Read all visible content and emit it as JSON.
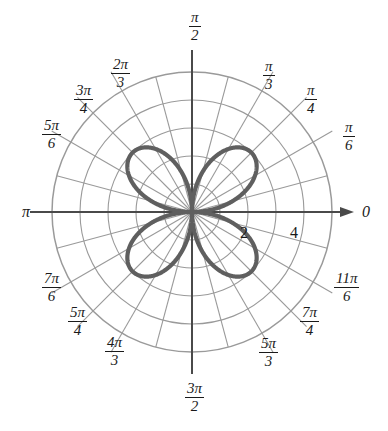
{
  "figure": {
    "title": "",
    "center": {
      "x": 192,
      "y": 212
    },
    "colors": {
      "curve": "#5f5f5f",
      "grid": "#9a9a9a",
      "axis": "#4a4a4a",
      "text": "#1a1a1a",
      "background": "#ffffff"
    }
  },
  "chart_data": {
    "type": "line",
    "subtype": "polar-rose",
    "title": "",
    "equation": "r = 3 sin(2θ)",
    "petal_count": 4,
    "petal_max_radius": 3,
    "petal_angles_deg": [
      45,
      135,
      225,
      315
    ],
    "r_axis": {
      "label": "",
      "range": [
        0,
        5
      ],
      "gridline_radii": [
        1,
        2,
        3,
        4,
        5
      ],
      "tick_labels": [
        "2",
        "4"
      ],
      "tick_values": [
        2,
        4
      ],
      "tick_positions_px": [
        {
          "label": "2",
          "x": 244,
          "y": 236
        },
        {
          "label": "4",
          "x": 294,
          "y": 236
        }
      ]
    },
    "theta_axis": {
      "label": "",
      "range_deg": [
        0,
        360
      ],
      "spoke_interval_deg": 15,
      "labeled_spoke_interval_deg": 30,
      "tick_labels": [
        "0",
        "π/6",
        "π/4",
        "π/3",
        "π/2",
        "2π/3",
        "3π/4",
        "5π/6",
        "π",
        "7π/6",
        "5π/4",
        "4π/3",
        "3π/2",
        "5π/3",
        "7π/4",
        "11π/6"
      ]
    },
    "grid": true,
    "legend": false,
    "series": [
      {
        "name": "r = 3 sin(2θ)",
        "color": "#5f5f5f",
        "points_polar": [
          {
            "theta_deg": 0,
            "r": 0
          },
          {
            "theta_deg": 15,
            "r": 1.5
          },
          {
            "theta_deg": 30,
            "r": 2.6
          },
          {
            "theta_deg": 45,
            "r": 3.0
          },
          {
            "theta_deg": 60,
            "r": 2.6
          },
          {
            "theta_deg": 75,
            "r": 1.5
          },
          {
            "theta_deg": 90,
            "r": 0
          },
          {
            "theta_deg": 135,
            "r": 3.0
          },
          {
            "theta_deg": 180,
            "r": 0
          },
          {
            "theta_deg": 225,
            "r": 3.0
          },
          {
            "theta_deg": 270,
            "r": 0
          },
          {
            "theta_deg": 315,
            "r": 3.0
          },
          {
            "theta_deg": 360,
            "r": 0
          }
        ]
      }
    ]
  },
  "angle_labels": [
    {
      "id": "theta-0",
      "text": "0",
      "kind": "plain",
      "x": 362,
      "y": 203
    },
    {
      "id": "theta-pi-6",
      "num": "π",
      "den": "6",
      "kind": "frac",
      "x": 343,
      "y": 120
    },
    {
      "id": "theta-pi-4",
      "num": "π",
      "den": "4",
      "kind": "frac",
      "x": 305,
      "y": 83
    },
    {
      "id": "theta-pi-3",
      "num": "π",
      "den": "3",
      "kind": "frac",
      "x": 263,
      "y": 59
    },
    {
      "id": "theta-pi-2",
      "num": "π",
      "den": "2",
      "kind": "frac",
      "x": 189,
      "y": 10
    },
    {
      "id": "theta-2pi-3",
      "num": "2π",
      "den": "3",
      "kind": "frac",
      "x": 111,
      "y": 57
    },
    {
      "id": "theta-3pi-4",
      "num": "3π",
      "den": "4",
      "kind": "frac",
      "x": 74,
      "y": 83
    },
    {
      "id": "theta-5pi-6",
      "num": "5π",
      "den": "6",
      "kind": "frac",
      "x": 42,
      "y": 118
    },
    {
      "id": "theta-pi",
      "text": "π",
      "kind": "plain",
      "x": 22,
      "y": 203
    },
    {
      "id": "theta-7pi-6",
      "num": "7π",
      "den": "6",
      "kind": "frac",
      "x": 42,
      "y": 271
    },
    {
      "id": "theta-5pi-4",
      "num": "5π",
      "den": "4",
      "kind": "frac",
      "x": 68,
      "y": 305
    },
    {
      "id": "theta-4pi-3",
      "num": "4π",
      "den": "3",
      "kind": "frac",
      "x": 105,
      "y": 335
    },
    {
      "id": "theta-3pi-2",
      "num": "3π",
      "den": "2",
      "kind": "frac",
      "x": 185,
      "y": 381
    },
    {
      "id": "theta-5pi-3",
      "num": "5π",
      "den": "3",
      "kind": "frac",
      "x": 259,
      "y": 336
    },
    {
      "id": "theta-7pi-4",
      "num": "7π",
      "den": "4",
      "kind": "frac",
      "x": 300,
      "y": 305
    },
    {
      "id": "theta-11pi-6",
      "num": "11π",
      "den": "6",
      "kind": "frac",
      "x": 334,
      "y": 271
    }
  ],
  "radial_labels": [
    {
      "id": "r-2",
      "text": "2",
      "x": 240,
      "y": 224
    },
    {
      "id": "r-4",
      "text": "4",
      "x": 290,
      "y": 224
    }
  ]
}
